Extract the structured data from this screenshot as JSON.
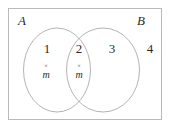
{
  "figure": {
    "name": "venn-diagram-two-sets",
    "universe_border_color": "#b9b9b9",
    "circle_stroke_color": "#aaaaaa",
    "background_color": "#ffffff",
    "text_color": "#2b2b2b"
  },
  "sets": {
    "left_label": "A",
    "right_label": "B"
  },
  "regions": [
    {
      "id": "region-1",
      "number": "1",
      "description": "A only"
    },
    {
      "id": "region-2",
      "number": "2",
      "description": "A intersect B"
    },
    {
      "id": "region-3",
      "number": "3",
      "description": "B only"
    },
    {
      "id": "region-4",
      "number": "4",
      "description": "outside A and B"
    }
  ],
  "points": [
    {
      "id": "point-left",
      "marker": "×",
      "label": "m",
      "region": "1"
    },
    {
      "id": "point-middle",
      "marker": "×",
      "label": "m",
      "region": "2"
    }
  ]
}
